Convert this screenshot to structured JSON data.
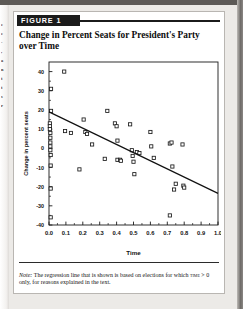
{
  "figure": {
    "badge_label": "FIGURE 1",
    "title": "Change in Percent Seats for President's Party over Time",
    "note_lead": "Note:",
    "note_part1": " The regression line that is shown is based on elections for which ",
    "note_var": "time",
    "note_part2": " > 0 only, for reasons explained in the text."
  },
  "margin_fragments": [
    "e",
    "e",
    "-",
    ",",
    "a",
    "n",
    "t",
    "t",
    "s",
    "r"
  ],
  "chart_data": {
    "type": "scatter",
    "title": "Change in Percent Seats for President's Party over Time",
    "xlabel": "Time",
    "ylabel": "Change in percent seats",
    "xlim": [
      0.0,
      1.0
    ],
    "ylim": [
      -40,
      45
    ],
    "xticks": [
      "0.0",
      "0.1",
      "0.2",
      "0.3",
      "0.4",
      "0.5",
      "0.6",
      "0.7",
      "0.8",
      "0.9",
      "1.0"
    ],
    "xtick_values": [
      0.0,
      0.1,
      0.2,
      0.3,
      0.4,
      0.5,
      0.6,
      0.7,
      0.8,
      0.9,
      1.0
    ],
    "yticks": [
      "40",
      "30",
      "20",
      "10",
      "0",
      "-10",
      "-20",
      "-30",
      "-40"
    ],
    "ytick_values": [
      40,
      30,
      20,
      10,
      0,
      -10,
      -20,
      -30,
      -40
    ],
    "grid": false,
    "legend": null,
    "marker": "open-square",
    "marker_color": "#1a1a1a",
    "line_color": "#111111",
    "regression_line": {
      "label": "regression line",
      "x_start": 0.0,
      "y_start": 19.0,
      "x_end": 1.0,
      "y_end": -23.5,
      "slope": -42.5,
      "intercept": 19.0
    },
    "points": [
      {
        "x": 0.005,
        "y": 13.0
      },
      {
        "x": 0.005,
        "y": 11.5
      },
      {
        "x": 0.005,
        "y": 10.0
      },
      {
        "x": 0.008,
        "y": 8.0
      },
      {
        "x": 0.008,
        "y": 5.5
      },
      {
        "x": 0.008,
        "y": 3.0
      },
      {
        "x": 0.008,
        "y": 1.0
      },
      {
        "x": 0.008,
        "y": -1.0
      },
      {
        "x": 0.01,
        "y": -3.5
      },
      {
        "x": 0.01,
        "y": -9.0
      },
      {
        "x": 0.01,
        "y": -21.0
      },
      {
        "x": 0.01,
        "y": -36.0
      },
      {
        "x": 0.012,
        "y": 31.0
      },
      {
        "x": 0.012,
        "y": 19.5
      },
      {
        "x": 0.09,
        "y": 40.0
      },
      {
        "x": 0.095,
        "y": 9.0
      },
      {
        "x": 0.13,
        "y": 8.0
      },
      {
        "x": 0.18,
        "y": -11.0
      },
      {
        "x": 0.205,
        "y": 15.0
      },
      {
        "x": 0.215,
        "y": 8.5
      },
      {
        "x": 0.225,
        "y": 7.5
      },
      {
        "x": 0.255,
        "y": 2.0
      },
      {
        "x": 0.33,
        "y": -5.5
      },
      {
        "x": 0.345,
        "y": 19.5
      },
      {
        "x": 0.39,
        "y": 13.0
      },
      {
        "x": 0.4,
        "y": 11.5
      },
      {
        "x": 0.405,
        "y": 4.0
      },
      {
        "x": 0.405,
        "y": -6.0
      },
      {
        "x": 0.42,
        "y": -6.0
      },
      {
        "x": 0.425,
        "y": -6.5
      },
      {
        "x": 0.48,
        "y": 12.5
      },
      {
        "x": 0.49,
        "y": -1.0
      },
      {
        "x": 0.495,
        "y": -4.0
      },
      {
        "x": 0.5,
        "y": -7.0
      },
      {
        "x": 0.505,
        "y": -13.5
      },
      {
        "x": 0.52,
        "y": -2.0
      },
      {
        "x": 0.535,
        "y": -2.5
      },
      {
        "x": 0.6,
        "y": 8.5
      },
      {
        "x": 0.605,
        "y": 1.0
      },
      {
        "x": 0.62,
        "y": -5.0
      },
      {
        "x": 0.715,
        "y": 2.5
      },
      {
        "x": 0.725,
        "y": 3.0
      },
      {
        "x": 0.73,
        "y": -9.5
      },
      {
        "x": 0.74,
        "y": -21.5
      },
      {
        "x": 0.75,
        "y": -18.5
      },
      {
        "x": 0.79,
        "y": 2.0
      },
      {
        "x": 0.795,
        "y": -19.5
      },
      {
        "x": 0.8,
        "y": -20.5
      },
      {
        "x": 0.715,
        "y": -35.0
      }
    ]
  }
}
